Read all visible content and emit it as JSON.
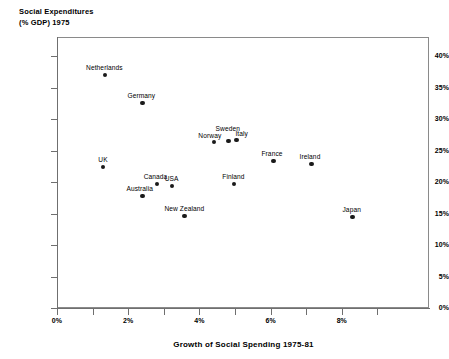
{
  "chart_data": {
    "type": "scatter",
    "title": "",
    "ylabel": "Social Expenditures\n(% GDP) 1975",
    "ylabel_line1": "Social Expenditures",
    "ylabel_line2": "(% GDP) 1975",
    "xlabel": "Growth of Social Spending 1975-81",
    "xlim": [
      0,
      9
    ],
    "ylim": [
      0,
      40
    ],
    "grid": false,
    "legend": "none",
    "x_ticks_major": [
      "0%",
      "2%",
      "4%",
      "6%",
      "8%"
    ],
    "x_tick_major_values": [
      0,
      2,
      4,
      6,
      8
    ],
    "x_tick_minor_values": [
      1,
      3,
      5,
      7,
      9
    ],
    "y_ticks": [
      "0%",
      "5%",
      "10%",
      "15%",
      "20%",
      "25%",
      "30%",
      "35%",
      "40%"
    ],
    "y_tick_values": [
      0,
      5,
      10,
      15,
      20,
      25,
      30,
      35,
      40
    ],
    "point_color": "#1a1a1a",
    "axis_color": "#6f6f6f",
    "points": [
      {
        "label": "Netherlands",
        "x": 1.35,
        "y": 37.0,
        "label_dx": -19,
        "label_dy": -11
      },
      {
        "label": "Germany",
        "x": 2.4,
        "y": 32.5,
        "label_dx": -15,
        "label_dy": -11
      },
      {
        "label": "UK",
        "x": 1.3,
        "y": 22.4,
        "label_dx": -5,
        "label_dy": -11
      },
      {
        "label": "Canada",
        "x": 2.8,
        "y": 19.7,
        "label_dx": -13,
        "label_dy": -11
      },
      {
        "label": "USA",
        "x": 3.22,
        "y": 19.4,
        "label_dx": -7,
        "label_dy": -11
      },
      {
        "label": "Australia",
        "x": 2.4,
        "y": 17.8,
        "label_dx": -16,
        "label_dy": -11
      },
      {
        "label": "New Zealand",
        "x": 3.58,
        "y": 14.6,
        "label_dx": -20,
        "label_dy": -11
      },
      {
        "label": "Norway",
        "x": 4.42,
        "y": 26.3,
        "label_dx": -16,
        "label_dy": -10
      },
      {
        "label": "Sweden",
        "x": 4.82,
        "y": 26.5,
        "label_dx": -13,
        "label_dy": -16
      },
      {
        "label": "Italy",
        "x": 5.04,
        "y": 26.7,
        "label_dx": -1,
        "label_dy": -10
      },
      {
        "label": "Finland",
        "x": 4.98,
        "y": 19.7,
        "label_dx": -12,
        "label_dy": -11
      },
      {
        "label": "France",
        "x": 6.08,
        "y": 23.3,
        "label_dx": -12,
        "label_dy": -11
      },
      {
        "label": "Ireland",
        "x": 7.15,
        "y": 22.9,
        "label_dx": -12,
        "label_dy": -11
      },
      {
        "label": "Japan",
        "x": 8.3,
        "y": 14.4,
        "label_dx": -10,
        "label_dy": -11
      }
    ]
  }
}
